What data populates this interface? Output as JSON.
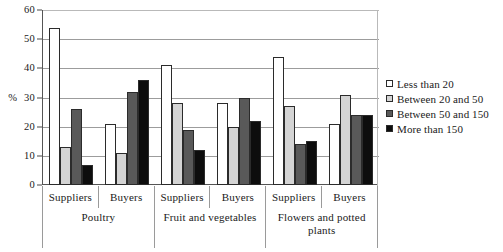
{
  "chart_data": {
    "type": "bar",
    "title": "",
    "xlabel": "",
    "ylabel": "%",
    "ylim": [
      0,
      60
    ],
    "yticks": [
      0,
      10,
      20,
      30,
      40,
      50,
      60
    ],
    "grid": true,
    "legend_position": "right",
    "categories": [
      "Poultry - Suppliers",
      "Poultry - Buyers",
      "Fruit and vegetables - Suppliers",
      "Fruit and vegetables - Buyers",
      "Flowers and potted plants - Suppliers",
      "Flowers and potted plants - Buyers"
    ],
    "groups": [
      {
        "name": "Poultry",
        "subgroups": [
          {
            "name": "Suppliers",
            "values": [
              54,
              13,
              26,
              7
            ]
          },
          {
            "name": "Buyers",
            "values": [
              21,
              11,
              32,
              36
            ]
          }
        ]
      },
      {
        "name": "Fruit and vegetables",
        "subgroups": [
          {
            "name": "Suppliers",
            "values": [
              41,
              28,
              19,
              12
            ]
          },
          {
            "name": "Buyers",
            "values": [
              28,
              20,
              30,
              22
            ]
          }
        ]
      },
      {
        "name": "Flowers and potted plants",
        "subgroups": [
          {
            "name": "Suppliers",
            "values": [
              44,
              27,
              14,
              15
            ]
          },
          {
            "name": "Buyers",
            "values": [
              21,
              31,
              24,
              24
            ]
          }
        ]
      }
    ],
    "series": [
      {
        "name": "Less than 20",
        "color": "#ffffff",
        "values": [
          54,
          21,
          41,
          28,
          44,
          21
        ]
      },
      {
        "name": "Between 20 and 50",
        "color": "#d4d4d4",
        "values": [
          13,
          11,
          28,
          20,
          27,
          31
        ]
      },
      {
        "name": "Between 50 and 150",
        "color": "#595959",
        "values": [
          26,
          32,
          19,
          30,
          14,
          24
        ]
      },
      {
        "name": "More than 150",
        "color": "#0d0d0d",
        "values": [
          7,
          36,
          12,
          22,
          15,
          24
        ]
      }
    ]
  },
  "axis": {
    "unit_label": "%",
    "tick_labels": [
      "0",
      "10",
      "20",
      "30",
      "40",
      "50",
      "60"
    ]
  },
  "legend": {
    "items": [
      {
        "label": "Less than 20"
      },
      {
        "label": "Between 20 and 50"
      },
      {
        "label": "Between 50 and 150"
      },
      {
        "label": "More than 150"
      }
    ]
  },
  "colors": {
    "series_1": "#ffffff",
    "series_2": "#d4d4d4",
    "series_3": "#595959",
    "series_4": "#0d0d0d",
    "axis": "#555555",
    "gridline": "#9c9c9c",
    "text": "#1a1a1a"
  }
}
